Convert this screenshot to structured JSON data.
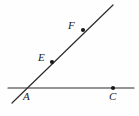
{
  "figure": {
    "type": "geometry-diagram",
    "width": 139,
    "height": 116,
    "background_color": "#fefefe",
    "stroke_color": "#2b2b2b",
    "point_color": "#1a1a1a",
    "label_color": "#1a1a1a",
    "stroke_width": 1.2,
    "point_radius": 2.1
  },
  "lines": [
    {
      "name": "horizontal-line-AC",
      "label": "line AC",
      "x1": 8,
      "y1": 88,
      "x2": 134,
      "y2": 88
    },
    {
      "name": "diagonal-ray-AF",
      "label": "ray AF",
      "x1": 12,
      "y1": 103,
      "x2": 113,
      "y2": 5
    }
  ],
  "points": [
    {
      "id": "A",
      "label": "A",
      "x": 22,
      "y": 88,
      "dot_visible": false,
      "label_position": "below-right"
    },
    {
      "id": "E",
      "label": "E",
      "x": 52,
      "y": 62,
      "dot_visible": true,
      "label_position": "left"
    },
    {
      "id": "F",
      "label": "F",
      "x": 83,
      "y": 30,
      "dot_visible": true,
      "label_position": "left"
    },
    {
      "id": "C",
      "label": "C",
      "x": 113,
      "y": 88,
      "dot_visible": true,
      "label_position": "below"
    }
  ]
}
